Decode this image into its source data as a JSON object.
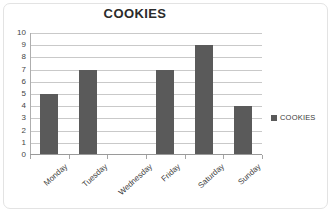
{
  "chart_data": {
    "type": "bar",
    "title": "COOKIES",
    "xlabel": "",
    "ylabel": "",
    "categories": [
      "Monday",
      "Tuesday",
      "Wednesday",
      "Friday",
      "Saturday",
      "Sunday"
    ],
    "values": [
      5,
      7,
      0,
      7,
      9,
      4
    ],
    "series": [
      {
        "name": "COOKIES",
        "values": [
          5,
          7,
          0,
          7,
          9,
          4
        ]
      }
    ],
    "ylim": [
      0,
      10
    ],
    "ytick_step": 1,
    "ytick_labels": [
      "10",
      "9",
      "8",
      "7",
      "6",
      "5",
      "4",
      "3",
      "2",
      "1",
      "0"
    ],
    "grid": "horizontal",
    "legend_position": "right",
    "legend_entries": [
      "COOKIES"
    ],
    "colors": {
      "bar": "#5a5a5a",
      "gridline": "#c9c9c9",
      "axis": "#9a9a9a",
      "title_text": "#2b2b2b",
      "tick_text": "#444444",
      "border": "#e3e3e3",
      "background": "#ffffff"
    }
  },
  "legend": {
    "series_label": "COOKIES"
  }
}
